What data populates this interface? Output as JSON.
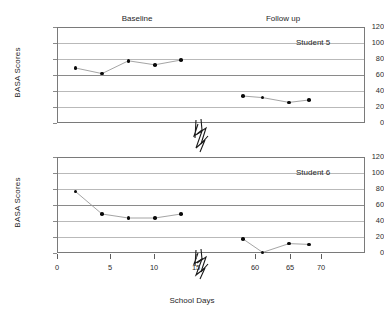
{
  "chart_data": [
    {
      "type": "line",
      "title": "",
      "subject": "Student 5",
      "xlabel": "",
      "ylabel": "BASA Scores",
      "ylim": [
        0,
        120
      ],
      "yticks": [
        0,
        20,
        40,
        60,
        80,
        100,
        120
      ],
      "xticks": [
        0,
        5,
        10,
        15,
        60,
        65,
        70
      ],
      "axis_break": {
        "after": 15,
        "before": 60,
        "marker": "zigzag"
      },
      "grid": "horizontal",
      "legend": "none",
      "phases": [
        {
          "name": "Baseline",
          "label": "Baseline"
        },
        {
          "name": "Follow up",
          "label": "Follow up"
        }
      ],
      "phase_divider_x": 16,
      "series": [
        {
          "name": "Student 5 Baseline",
          "phase": "Baseline",
          "points": [
            {
              "x": 2,
              "y": 70
            },
            {
              "x": 5,
              "y": 63
            },
            {
              "x": 8,
              "y": 79
            },
            {
              "x": 11,
              "y": 74
            },
            {
              "x": 14,
              "y": 80
            }
          ]
        },
        {
          "name": "Student 5 Follow up",
          "phase": "Follow up",
          "points": [
            {
              "x": 58,
              "y": 35
            },
            {
              "x": 61,
              "y": 33
            },
            {
              "x": 65,
              "y": 27
            },
            {
              "x": 68,
              "y": 30
            }
          ]
        }
      ]
    },
    {
      "type": "line",
      "title": "",
      "subject": "Student 6",
      "xlabel": "School Days",
      "ylabel": "BASA Scores",
      "ylim": [
        0,
        120
      ],
      "yticks": [
        0,
        20,
        40,
        60,
        80,
        100,
        120
      ],
      "xticks": [
        0,
        5,
        10,
        15,
        60,
        65,
        70
      ],
      "axis_break": {
        "after": 15,
        "before": 60,
        "marker": "zigzag"
      },
      "grid": "horizontal",
      "legend": "none",
      "phases": [
        {
          "name": "Baseline",
          "label": "Baseline"
        },
        {
          "name": "Follow up",
          "label": "Follow up"
        }
      ],
      "phase_divider_x": 16,
      "series": [
        {
          "name": "Student 6 Baseline",
          "phase": "Baseline",
          "points": [
            {
              "x": 2,
              "y": 78
            },
            {
              "x": 5,
              "y": 50
            },
            {
              "x": 8,
              "y": 45
            },
            {
              "x": 11,
              "y": 45
            },
            {
              "x": 14,
              "y": 50
            }
          ]
        },
        {
          "name": "Student 6 Follow up",
          "phase": "Follow up",
          "points": [
            {
              "x": 58,
              "y": 19
            },
            {
              "x": 61,
              "y": 2
            },
            {
              "x": 65,
              "y": 13
            },
            {
              "x": 68,
              "y": 12
            }
          ]
        }
      ]
    }
  ],
  "axes": {
    "y_title": "BASA Scores",
    "x_title": "School Days",
    "y_tick_labels": [
      "120",
      "100",
      "80",
      "60",
      "40",
      "20",
      "0"
    ],
    "x_tick_labels": [
      "0",
      "5",
      "10",
      "15",
      "60",
      "65",
      "70"
    ]
  },
  "panels": {
    "top": {
      "subject_label": "Student 5",
      "baseline_label": "Baseline",
      "followup_label": "Follow up"
    },
    "bottom": {
      "subject_label": "Student 6"
    }
  },
  "colors": {
    "marker": "#0a0a0a",
    "connector": "#9a9a9a",
    "gridline": "#b9b9b9",
    "frame": "#7a7a7a",
    "divider": "#111111",
    "text": "#1f1f1f",
    "background": "#ffffff"
  }
}
